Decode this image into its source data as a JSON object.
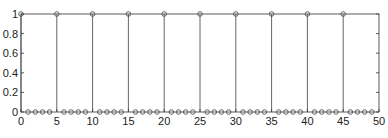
{
  "chart_data": {
    "type": "stem",
    "title": "",
    "xlabel": "",
    "ylabel": "",
    "xlim": [
      0,
      50
    ],
    "ylim": [
      0,
      1
    ],
    "grid": false,
    "x_ticks": [
      "0",
      "5",
      "10",
      "15",
      "20",
      "25",
      "30",
      "35",
      "40",
      "45",
      "50"
    ],
    "y_ticks": [
      "0",
      "0.2",
      "0.4",
      "0.6",
      "0.8",
      "1"
    ],
    "x": [
      0,
      1,
      2,
      3,
      4,
      5,
      6,
      7,
      8,
      9,
      10,
      11,
      12,
      13,
      14,
      15,
      16,
      17,
      18,
      19,
      20,
      21,
      22,
      23,
      24,
      25,
      26,
      27,
      28,
      29,
      30,
      31,
      32,
      33,
      34,
      35,
      36,
      37,
      38,
      39,
      40,
      41,
      42,
      43,
      44,
      45,
      46,
      47,
      48,
      49
    ],
    "values": [
      1,
      0,
      0,
      0,
      0,
      1,
      0,
      0,
      0,
      0,
      1,
      0,
      0,
      0,
      0,
      1,
      0,
      0,
      0,
      0,
      1,
      0,
      0,
      0,
      0,
      1,
      0,
      0,
      0,
      0,
      1,
      0,
      0,
      0,
      0,
      1,
      0,
      0,
      0,
      0,
      1,
      0,
      0,
      0,
      0,
      1,
      0,
      0,
      0,
      0
    ],
    "colors": {
      "line": "#555555",
      "marker": "#555555",
      "axis": "#333333"
    }
  }
}
